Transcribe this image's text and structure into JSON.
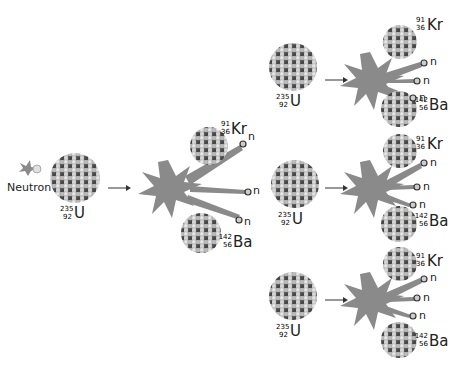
{
  "diagram": {
    "incoming": {
      "label": "Neutron"
    },
    "uranium": {
      "symbol": "U",
      "mass": "235",
      "atomic": "92"
    },
    "krypton": {
      "symbol": "Kr",
      "mass": "91",
      "atomic": "36"
    },
    "barium": {
      "symbol": "Ba",
      "mass": "142",
      "atomic": "56"
    },
    "neutron_symbol": "n",
    "colors": {
      "burst": "#8a8a8a",
      "nucleus_light": "#d8d8d8",
      "nucleus_dark": "#4a4a4a",
      "arrow": "#333333"
    }
  }
}
